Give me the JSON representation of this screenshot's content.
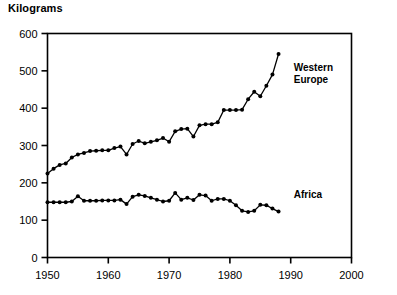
{
  "chart_data": {
    "type": "line",
    "title": "Kilograms",
    "xlabel": "",
    "ylabel": "",
    "xlim": [
      1950,
      2000
    ],
    "ylim": [
      0,
      600
    ],
    "grid": false,
    "legend_position": "inline-right",
    "x_ticks": [
      "1950",
      "1960",
      "1970",
      "1980",
      "1990",
      "2000"
    ],
    "x_tick_values": [
      1950,
      1960,
      1970,
      1980,
      1990,
      2000
    ],
    "y_ticks": [
      "0",
      "100",
      "200",
      "300",
      "400",
      "500",
      "600"
    ],
    "y_tick_values": [
      0,
      100,
      200,
      300,
      400,
      500,
      600
    ],
    "marker": "filled-circle",
    "line_color": "#000000",
    "series": [
      {
        "name": "Western Europe",
        "label_lines": [
          "Western",
          "Europe"
        ],
        "x": [
          1950,
          1951,
          1952,
          1953,
          1954,
          1955,
          1956,
          1957,
          1958,
          1959,
          1960,
          1961,
          1962,
          1963,
          1964,
          1965,
          1966,
          1967,
          1968,
          1969,
          1970,
          1971,
          1972,
          1973,
          1974,
          1975,
          1976,
          1977,
          1978,
          1979,
          1980,
          1981,
          1982,
          1983,
          1984,
          1985,
          1986,
          1987,
          1988
        ],
        "values": [
          225,
          238,
          248,
          252,
          268,
          276,
          280,
          285,
          286,
          287,
          287,
          293,
          297,
          276,
          304,
          312,
          306,
          310,
          314,
          320,
          310,
          338,
          344,
          345,
          324,
          354,
          357,
          357,
          362,
          395,
          395,
          395,
          396,
          424,
          444,
          432,
          460,
          490,
          545
        ]
      },
      {
        "name": "Africa",
        "label_lines": [
          "Africa"
        ],
        "x": [
          1950,
          1951,
          1952,
          1953,
          1954,
          1955,
          1956,
          1957,
          1958,
          1959,
          1960,
          1961,
          1962,
          1963,
          1964,
          1965,
          1966,
          1967,
          1968,
          1969,
          1970,
          1971,
          1972,
          1973,
          1974,
          1975,
          1976,
          1977,
          1978,
          1979,
          1980,
          1981,
          1982,
          1983,
          1984,
          1985,
          1986,
          1987,
          1988
        ],
        "values": [
          148,
          148,
          148,
          148,
          150,
          164,
          152,
          152,
          152,
          153,
          153,
          153,
          155,
          143,
          163,
          168,
          165,
          160,
          155,
          150,
          152,
          173,
          155,
          160,
          154,
          168,
          166,
          152,
          157,
          157,
          152,
          140,
          125,
          122,
          125,
          141,
          140,
          131,
          123
        ]
      }
    ],
    "annotations": [
      {
        "text": "Western Europe",
        "x": 1990.5,
        "y": 500
      },
      {
        "text": "Africa",
        "x": 1990.5,
        "y": 160
      }
    ]
  }
}
